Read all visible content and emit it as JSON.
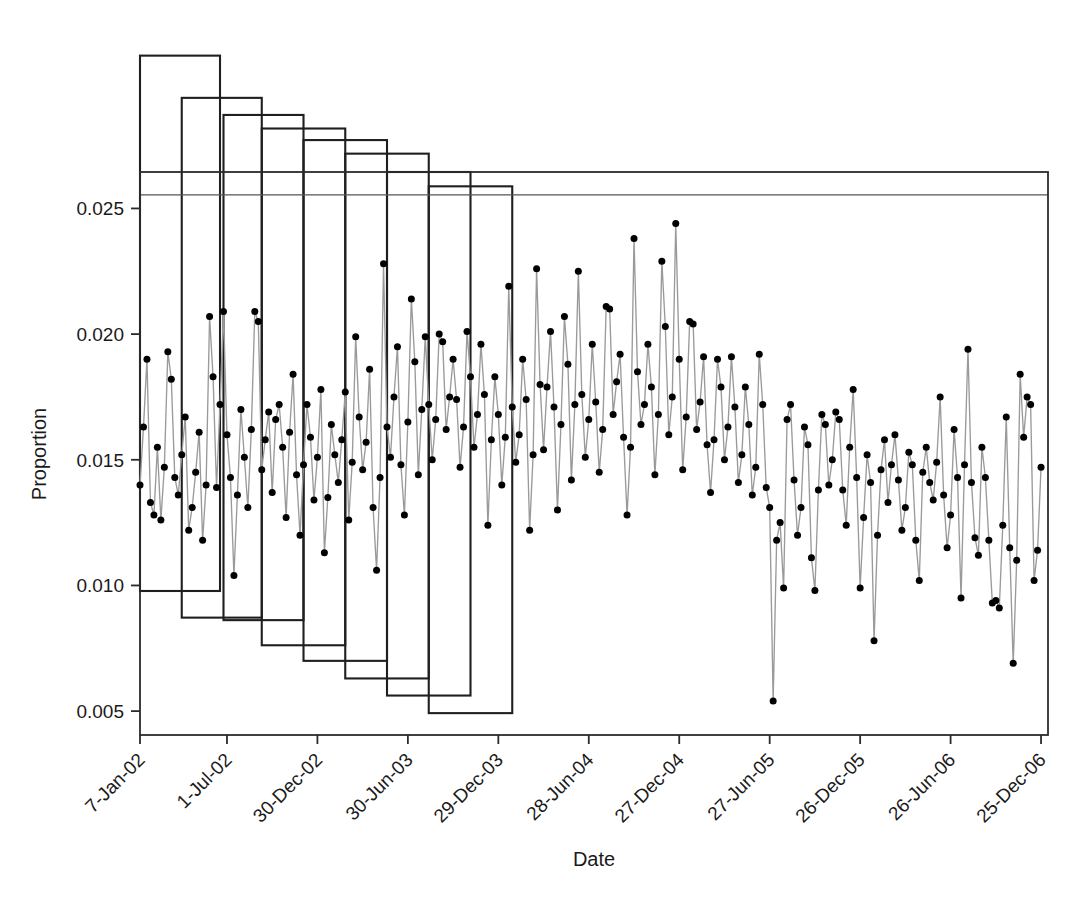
{
  "chart_data": {
    "type": "line",
    "title": "",
    "subtitle": "",
    "xlabel": "Date",
    "ylabel": "Proportion",
    "grid": false,
    "legend": null,
    "annotations": [
      {
        "name": "upper-reference-line",
        "type": "horizontal-line",
        "y": 0.02554
      },
      {
        "name": "change-windows",
        "type": "rectangles",
        "count": 8,
        "note": "Eight overlapping open rectangles (moving-window boxes) whose top and bottom edges step downward left-to-right; tops extend above the plot region."
      }
    ],
    "xlim": [
      0,
      261
    ],
    "ylim": [
      0.00405,
      0.02645
    ],
    "yticks": [
      0.005,
      0.01,
      0.015,
      0.02,
      0.025
    ],
    "ytick_labels": [
      "0.005",
      "0.010",
      "0.015",
      "0.020",
      "0.025"
    ],
    "xticks": [
      0,
      25,
      51,
      77,
      103,
      129,
      155,
      181,
      207,
      233,
      259
    ],
    "xtick_labels": [
      "7-Jan-02",
      "1-Jul-02",
      "30-Dec-02",
      "30-Jun-03",
      "29-Dec-03",
      "28-Jun-04",
      "27-Dec-04",
      "27-Jun-05",
      "26-Dec-05",
      "26-Jun-06",
      "25-Dec-06"
    ],
    "series": [
      {
        "name": "Proportion",
        "marker": "filled-circle",
        "marker_color": "#000000",
        "line_color": "#9a9a9a",
        "x": [
          0,
          1,
          2,
          3,
          4,
          5,
          6,
          7,
          8,
          9,
          10,
          11,
          12,
          13,
          14,
          15,
          16,
          17,
          18,
          19,
          20,
          21,
          22,
          23,
          24,
          25,
          26,
          27,
          28,
          29,
          30,
          31,
          32,
          33,
          34,
          35,
          36,
          37,
          38,
          39,
          40,
          41,
          42,
          43,
          44,
          45,
          46,
          47,
          48,
          49,
          50,
          51,
          52,
          53,
          54,
          55,
          56,
          57,
          58,
          59,
          60,
          61,
          62,
          63,
          64,
          65,
          66,
          67,
          68,
          69,
          70,
          71,
          72,
          73,
          74,
          75,
          76,
          77,
          78,
          79,
          80,
          81,
          82,
          83,
          84,
          85,
          86,
          87,
          88,
          89,
          90,
          91,
          92,
          93,
          94,
          95,
          96,
          97,
          98,
          99,
          100,
          101,
          102,
          103,
          104,
          105,
          106,
          107,
          108,
          109,
          110,
          111,
          112,
          113,
          114,
          115,
          116,
          117,
          118,
          119,
          120,
          121,
          122,
          123,
          124,
          125,
          126,
          127,
          128,
          129,
          130,
          131,
          132,
          133,
          134,
          135,
          136,
          137,
          138,
          139,
          140,
          141,
          142,
          143,
          144,
          145,
          146,
          147,
          148,
          149,
          150,
          151,
          152,
          153,
          154,
          155,
          156,
          157,
          158,
          159,
          160,
          161,
          162,
          163,
          164,
          165,
          166,
          167,
          168,
          169,
          170,
          171,
          172,
          173,
          174,
          175,
          176,
          177,
          178,
          179,
          180,
          181,
          182,
          183,
          184,
          185,
          186,
          187,
          188,
          189,
          190,
          191,
          192,
          193,
          194,
          195,
          196,
          197,
          198,
          199,
          200,
          201,
          202,
          203,
          204,
          205,
          206,
          207,
          208,
          209,
          210,
          211,
          212,
          213,
          214,
          215,
          216,
          217,
          218,
          219,
          220,
          221,
          222,
          223,
          224,
          225,
          226,
          227,
          228,
          229,
          230,
          231,
          232,
          233,
          234,
          235,
          236,
          237,
          238,
          239,
          240,
          241,
          242,
          243,
          244,
          245,
          246,
          247,
          248,
          249,
          250,
          251,
          252,
          253,
          254,
          255,
          256,
          257,
          258,
          259
        ],
        "values": [
          0.014,
          0.0163,
          0.019,
          0.0133,
          0.0128,
          0.0155,
          0.0126,
          0.0147,
          0.0193,
          0.0182,
          0.0143,
          0.0136,
          0.0152,
          0.0167,
          0.0122,
          0.0131,
          0.0145,
          0.0161,
          0.0118,
          0.014,
          0.0207,
          0.0183,
          0.0139,
          0.0172,
          0.0209,
          0.016,
          0.0143,
          0.0104,
          0.0136,
          0.017,
          0.0151,
          0.0131,
          0.0162,
          0.0209,
          0.0205,
          0.0146,
          0.0158,
          0.0169,
          0.0137,
          0.0166,
          0.0172,
          0.0155,
          0.0127,
          0.0161,
          0.0184,
          0.0144,
          0.012,
          0.0148,
          0.0172,
          0.0159,
          0.0134,
          0.0151,
          0.0178,
          0.0113,
          0.0135,
          0.0164,
          0.0152,
          0.0141,
          0.0158,
          0.0177,
          0.0126,
          0.0149,
          0.0199,
          0.0167,
          0.0146,
          0.0157,
          0.0186,
          0.0131,
          0.0106,
          0.0143,
          0.0228,
          0.0163,
          0.0151,
          0.0175,
          0.0195,
          0.0148,
          0.0128,
          0.0165,
          0.0214,
          0.0189,
          0.0144,
          0.017,
          0.0199,
          0.0172,
          0.015,
          0.0166,
          0.02,
          0.0197,
          0.0162,
          0.0175,
          0.019,
          0.0174,
          0.0147,
          0.0163,
          0.0201,
          0.0183,
          0.0155,
          0.0168,
          0.0196,
          0.0176,
          0.0124,
          0.0158,
          0.0183,
          0.0168,
          0.014,
          0.0159,
          0.0219,
          0.0171,
          0.0149,
          0.016,
          0.019,
          0.0174,
          0.0122,
          0.0152,
          0.0226,
          0.018,
          0.0154,
          0.0179,
          0.0201,
          0.0171,
          0.013,
          0.0164,
          0.0207,
          0.0188,
          0.0142,
          0.0172,
          0.0225,
          0.0176,
          0.0151,
          0.0166,
          0.0196,
          0.0173,
          0.0145,
          0.0162,
          0.0211,
          0.021,
          0.0168,
          0.0181,
          0.0192,
          0.0159,
          0.0128,
          0.0155,
          0.0238,
          0.0185,
          0.0164,
          0.0172,
          0.0196,
          0.0179,
          0.0144,
          0.0168,
          0.0229,
          0.0203,
          0.016,
          0.0175,
          0.0244,
          0.019,
          0.0146,
          0.0167,
          0.0205,
          0.0204,
          0.0162,
          0.0173,
          0.0191,
          0.0156,
          0.0137,
          0.0158,
          0.019,
          0.0179,
          0.015,
          0.0163,
          0.0191,
          0.0171,
          0.0141,
          0.0152,
          0.0179,
          0.0164,
          0.0136,
          0.0147,
          0.0192,
          0.0172,
          0.0139,
          0.0131,
          0.0054,
          0.0118,
          0.0125,
          0.0099,
          0.0166,
          0.0172,
          0.0142,
          0.012,
          0.0131,
          0.0163,
          0.0156,
          0.0111,
          0.0098,
          0.0138,
          0.0168,
          0.0164,
          0.014,
          0.015,
          0.0169,
          0.0166,
          0.0138,
          0.0124,
          0.0155,
          0.0178,
          0.0143,
          0.0099,
          0.0127,
          0.0152,
          0.0141,
          0.0078,
          0.012,
          0.0146,
          0.0158,
          0.0133,
          0.0148,
          0.016,
          0.0142,
          0.0122,
          0.0131,
          0.0153,
          0.0148,
          0.0118,
          0.0102,
          0.0145,
          0.0155,
          0.0141,
          0.0134,
          0.0149,
          0.0175,
          0.0136,
          0.0115,
          0.0128,
          0.0162,
          0.0143,
          0.0095,
          0.0148,
          0.0194,
          0.0141,
          0.0119,
          0.0112,
          0.0155,
          0.0143,
          0.0118,
          0.0093,
          0.0094,
          0.0091,
          0.0124,
          0.0167,
          0.0115,
          0.0069,
          0.011,
          0.0184,
          0.0159,
          0.0175,
          0.0172,
          0.0102,
          0.0114,
          0.0147
        ]
      }
    ],
    "rectangles": [
      {
        "x0": 0,
        "x1": 23,
        "y0": 0.00978,
        "y1": 0.03108
      },
      {
        "x0": 12,
        "x1": 35,
        "y0": 0.00872,
        "y1": 0.0294
      },
      {
        "x0": 24,
        "x1": 47,
        "y0": 0.00862,
        "y1": 0.02872
      },
      {
        "x0": 35,
        "x1": 59,
        "y0": 0.00762,
        "y1": 0.02818
      },
      {
        "x0": 47,
        "x1": 71,
        "y0": 0.007,
        "y1": 0.02772
      },
      {
        "x0": 59,
        "x1": 83,
        "y0": 0.0063,
        "y1": 0.02718
      },
      {
        "x0": 71,
        "x1": 95,
        "y0": 0.00562,
        "y1": 0.02645
      },
      {
        "x0": 83,
        "x1": 107,
        "y0": 0.00492,
        "y1": 0.02588
      }
    ]
  },
  "axes": {
    "y_title": "Proportion",
    "x_title": "Date"
  },
  "colors": {
    "marker": "#000000",
    "line": "#9a9a9a",
    "frame": "#2b2b2b",
    "box": "#1f1f1f",
    "reference_line": "#555555",
    "background": "#ffffff"
  }
}
